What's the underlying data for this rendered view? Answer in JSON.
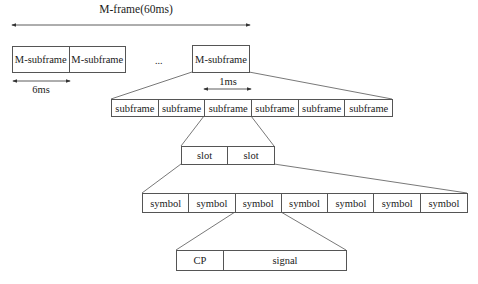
{
  "diagram": {
    "title": "M-frame(60ms)",
    "top_row": {
      "cells": [
        "M-subframe",
        "M-subframe"
      ],
      "duration_label": "6ms"
    },
    "ellipsis": "...",
    "expanded_msubframe": {
      "label": "M-subframe"
    },
    "subframe_row": {
      "cells": [
        "subframe",
        "subframe",
        "subframe",
        "subframe",
        "subframe",
        "subframe"
      ],
      "duration_label": "1ms"
    },
    "slot_row": {
      "cells": [
        "slot",
        "slot"
      ]
    },
    "symbol_row": {
      "cells": [
        "symbol",
        "symbol",
        "symbol",
        "symbol",
        "symbol",
        "symbol",
        "symbol"
      ]
    },
    "symbol_detail_row": {
      "cells": [
        "CP",
        "signal"
      ]
    },
    "colors": {
      "line": "#555555",
      "text": "#1a1a1a",
      "background": "#ffffff"
    }
  }
}
